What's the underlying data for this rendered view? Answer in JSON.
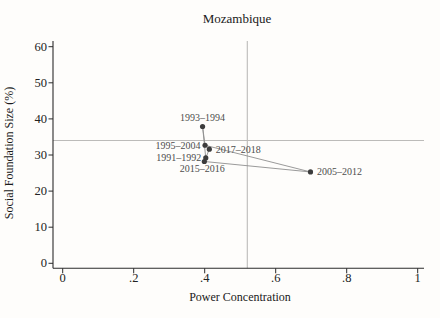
{
  "figure": {
    "colors": {
      "background": "#fefdfb",
      "axis": "#2b2b2b",
      "text": "#1a1a1a",
      "point_label": "#4d4d4d",
      "marker": "#3c3c3c",
      "data_line": "#8f8f8f",
      "ref_line": "#bcbbb9"
    }
  },
  "chart_data": {
    "type": "line",
    "title": "Mozambique",
    "xlabel": "Power Concentration",
    "ylabel": "Social Foundation Size (%)",
    "xlim": [
      0,
      1
    ],
    "ylim": [
      0,
      60
    ],
    "xticks": [
      0,
      0.2,
      0.4,
      0.6,
      0.8,
      1
    ],
    "xtick_labels": [
      "0",
      ".2",
      ".4",
      ".6",
      ".8",
      "1"
    ],
    "yticks": [
      0,
      10,
      20,
      30,
      40,
      50,
      60
    ],
    "ytick_labels": [
      "0",
      "10",
      "20",
      "30",
      "40",
      "50",
      "60"
    ],
    "grid": false,
    "legend": false,
    "reference_lines": {
      "x": 0.52,
      "y": 34
    },
    "series": [
      {
        "name": "Mozambique trajectory",
        "points": [
          {
            "period": "1991–1992",
            "x": 0.403,
            "y": 29.2,
            "label_side": "left"
          },
          {
            "period": "1993–1994",
            "x": 0.394,
            "y": 37.9,
            "label_side": "above"
          },
          {
            "period": "1995–2004",
            "x": 0.401,
            "y": 32.7,
            "label_side": "left"
          },
          {
            "period": "2005–2012",
            "x": 0.698,
            "y": 25.3,
            "label_side": "right"
          },
          {
            "period": "2015–2016",
            "x": 0.399,
            "y": 28.2,
            "label_side": "below"
          },
          {
            "period": "2017–2018",
            "x": 0.413,
            "y": 31.6,
            "label_side": "right"
          }
        ]
      }
    ]
  }
}
